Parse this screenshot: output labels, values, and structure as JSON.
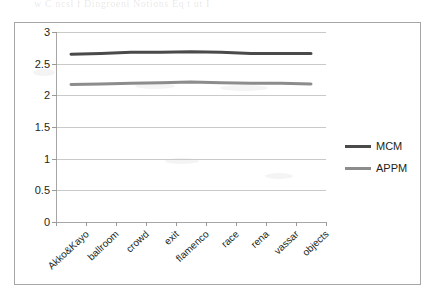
{
  "page": {
    "ghost_header_text": "w C ncsl f Dingroeni  Notions  Eq t ut I"
  },
  "legend": {
    "position": "right",
    "entries": [
      {
        "label": "MCM",
        "color": "#4a4a4a"
      },
      {
        "label": "APPM",
        "color": "#8c8c8c"
      }
    ]
  },
  "chart_data": {
    "type": "line",
    "title": "",
    "xlabel": "",
    "ylabel": "",
    "ylim": [
      0,
      3
    ],
    "yticks": [
      "0",
      "0.5",
      "1",
      "1.5",
      "2",
      "2.5",
      "3"
    ],
    "ytick_values": [
      0,
      0.5,
      1,
      1.5,
      2,
      2.5,
      3
    ],
    "grid": true,
    "legend_position": "right",
    "categories": [
      "Akko&Kayo",
      "ballroom",
      "crowd",
      "exit",
      "flamenco",
      "race",
      "rena",
      "vassar",
      "objects"
    ],
    "series": [
      {
        "name": "MCM",
        "color": "#4a4a4a",
        "values": [
          2.65,
          2.66,
          2.68,
          2.68,
          2.69,
          2.68,
          2.66,
          2.66,
          2.66
        ]
      },
      {
        "name": "APPM",
        "color": "#8c8c8c",
        "values": [
          2.17,
          2.18,
          2.19,
          2.2,
          2.21,
          2.2,
          2.19,
          2.19,
          2.18
        ]
      }
    ]
  }
}
